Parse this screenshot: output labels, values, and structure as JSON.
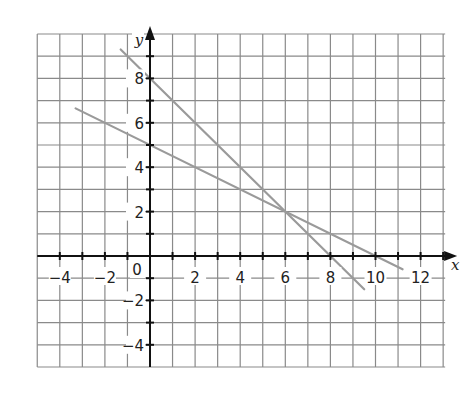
{
  "chart_data": {
    "type": "line",
    "title": "",
    "xlabel": "x",
    "ylabel": "y",
    "xlim": [
      -5,
      13
    ],
    "ylim": [
      -5,
      10
    ],
    "grid": true,
    "x_ticks": [
      -4,
      -2,
      0,
      2,
      4,
      6,
      8,
      10,
      12
    ],
    "x_tick_labels": [
      "−4",
      "−2",
      "0",
      "2",
      "4",
      "6",
      "8",
      "10",
      "12"
    ],
    "y_ticks": [
      -4,
      -2,
      2,
      4,
      6,
      8
    ],
    "y_tick_labels": [
      "−4",
      "−2",
      "2",
      "4",
      "6",
      "8"
    ],
    "origin_label": "0",
    "series": [
      {
        "name": "y = 8 − x",
        "x": [
          -1.3,
          9.5
        ],
        "y": [
          9.3,
          -1.5
        ],
        "color": "#9a9a9a"
      },
      {
        "name": "y = 5 − x/2",
        "x": [
          -3.3,
          11.2
        ],
        "y": [
          6.65,
          -0.6
        ],
        "color": "#9a9a9a"
      }
    ],
    "annotations": [
      {
        "text": "intersection",
        "x": 6,
        "y": 2
      }
    ],
    "colors": {
      "grid": "#8a8a8a",
      "axis": "#111111",
      "line": "#9a9a9a"
    }
  }
}
